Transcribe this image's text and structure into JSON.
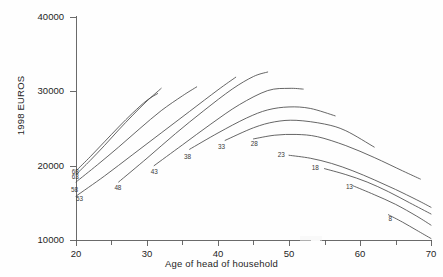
{
  "chart_data": {
    "type": "line",
    "title": "",
    "xlabel": "Age of head of household",
    "ylabel": "1998 EUROS",
    "xlim": [
      18,
      72
    ],
    "ylim": [
      9000,
      41000
    ],
    "xticks": [
      20,
      30,
      40,
      50,
      60,
      70
    ],
    "xtick_labels": [
      "20",
      "30",
      "40",
      "50",
      "60",
      "70"
    ],
    "xminorticks": [
      25,
      35,
      45,
      55,
      65
    ],
    "yticks": [
      10000,
      20000,
      30000,
      40000
    ],
    "ytick_labels": [
      "10000",
      "20000",
      "30000",
      "40000"
    ],
    "grid": false,
    "legend": "none",
    "series_label_note": "Each line is labelled at its starting end with the cohort birth-year code",
    "series": [
      {
        "name": "68",
        "label": "68",
        "label_x": 20.4,
        "label_y": 19150,
        "x": [
          20,
          22,
          24,
          26,
          28,
          30,
          31.5
        ],
        "values": [
          19300,
          21200,
          23200,
          25200,
          27100,
          28800,
          29700
        ]
      },
      {
        "name": "63",
        "label": "63",
        "label_x": 20.4,
        "label_y": 18500,
        "x": [
          20,
          22,
          24,
          26,
          28,
          30,
          32
        ],
        "values": [
          18800,
          20700,
          22700,
          24800,
          26800,
          28700,
          30400
        ]
      },
      {
        "name": "58",
        "label": "58",
        "label_x": 20.3,
        "label_y": 16800,
        "x": [
          20,
          23,
          26,
          29,
          32,
          35,
          37
        ],
        "values": [
          17800,
          20100,
          22500,
          25000,
          27400,
          29400,
          30600
        ]
      },
      {
        "name": "53",
        "label": "53",
        "label_x": 21.0,
        "label_y": 15500,
        "x": [
          20,
          24,
          28,
          32,
          36,
          40,
          42.5
        ],
        "values": [
          15900,
          18600,
          21500,
          24400,
          27300,
          30200,
          31900
        ]
      },
      {
        "name": "48",
        "label": "48",
        "label_x": 26.4,
        "label_y": 17000,
        "x": [
          26,
          30,
          34,
          38,
          42,
          45,
          47
        ],
        "values": [
          17800,
          21000,
          24300,
          27400,
          30300,
          32000,
          32600
        ]
      },
      {
        "name": "43",
        "label": "43",
        "label_x": 31.5,
        "label_y": 19100,
        "x": [
          31,
          35,
          39,
          43,
          47,
          50,
          52
        ],
        "values": [
          20000,
          22800,
          25600,
          28200,
          30100,
          30400,
          30300
        ]
      },
      {
        "name": "38",
        "label": "38",
        "label_x": 36.2,
        "label_y": 21200,
        "x": [
          36,
          40,
          44,
          47,
          50,
          53,
          56.5
        ],
        "values": [
          22200,
          24400,
          26400,
          27500,
          27900,
          27700,
          26700
        ]
      },
      {
        "name": "33",
        "label": "33",
        "label_x": 41.0,
        "label_y": 22500,
        "x": [
          41,
          45,
          48,
          51,
          55,
          58,
          62
        ],
        "values": [
          23400,
          25100,
          25900,
          26100,
          25600,
          24700,
          22500
        ]
      },
      {
        "name": "28",
        "label": "28",
        "label_x": 45.6,
        "label_y": 22900,
        "x": [
          45,
          48,
          51,
          54,
          58,
          62,
          66,
          68.5
        ],
        "values": [
          23600,
          24100,
          24200,
          23900,
          22700,
          21100,
          19300,
          18200
        ]
      },
      {
        "name": "23",
        "label": "23",
        "label_x": 49.4,
        "label_y": 21400,
        "x": [
          50,
          53,
          56,
          59,
          62,
          65,
          68,
          70
        ],
        "values": [
          21400,
          21000,
          20300,
          19300,
          18100,
          16800,
          15400,
          14400
        ]
      },
      {
        "name": "18",
        "label": "18",
        "label_x": 54.2,
        "label_y": 19700,
        "x": [
          55,
          58,
          61,
          64,
          67,
          70
        ],
        "values": [
          19600,
          18800,
          17800,
          16500,
          15000,
          13500
        ]
      },
      {
        "name": "13",
        "label": "13",
        "label_x": 59.0,
        "label_y": 17100,
        "x": [
          59,
          62,
          65,
          68,
          70
        ],
        "values": [
          17300,
          16100,
          14800,
          13200,
          12000
        ]
      },
      {
        "name": "8",
        "label": "8",
        "label_x": 65.0,
        "label_y": 12800,
        "x": [
          64,
          66,
          68,
          70
        ],
        "values": [
          13400,
          12400,
          11300,
          10200
        ]
      }
    ]
  },
  "figure": {
    "ylabel_text": "1998 EUROS",
    "xlabel_text": "Age of head of household"
  }
}
